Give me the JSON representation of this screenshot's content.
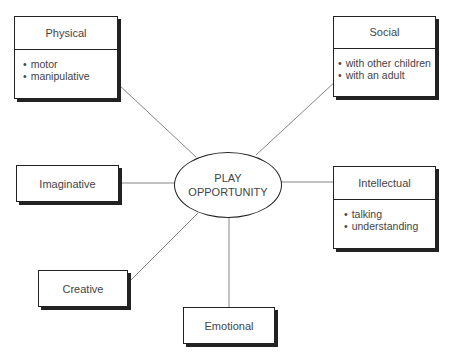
{
  "center": {
    "line1": "PLAY",
    "line2": "OPPORTUNITY"
  },
  "nodes": {
    "physical": {
      "title": "Physical",
      "items": [
        "motor",
        "manipulative"
      ]
    },
    "social": {
      "title": "Social",
      "items": [
        "with other children",
        "with an adult"
      ]
    },
    "intellectual": {
      "title": "Intellectual",
      "items": [
        "talking",
        "understanding"
      ]
    },
    "imaginative": {
      "title": "Imaginative"
    },
    "creative": {
      "title": "Creative"
    },
    "emotional": {
      "title": "Emotional"
    }
  }
}
